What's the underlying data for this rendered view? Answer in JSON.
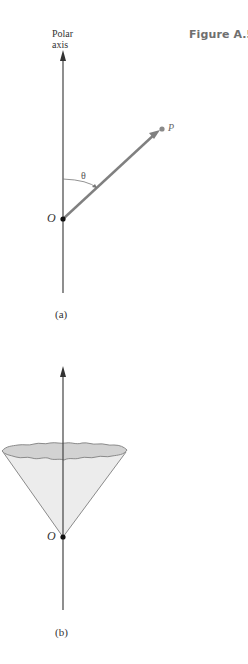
{
  "figure": {
    "title": "Figure A.5",
    "title_color": "#6f6f6f"
  },
  "panel_a": {
    "axis_label_line1": "Polar",
    "axis_label_line2": "axis",
    "origin_label": "O",
    "point_label": "P",
    "angle_label": "θ",
    "caption": "(a)",
    "vector_color": "#808080",
    "point_color": "#8a8a8a"
  },
  "panel_b": {
    "origin_label": "O",
    "caption": "(b)",
    "cone_fill": "#ececec",
    "cone_top_fill": "#d2d2d2",
    "cone_stroke": "#8a8a8a"
  }
}
